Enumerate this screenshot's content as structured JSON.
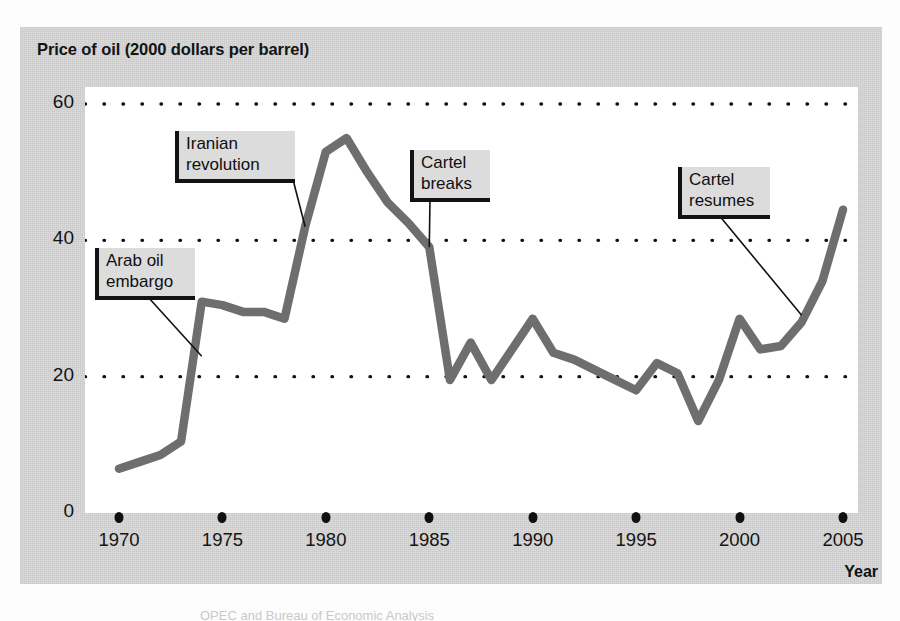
{
  "figure": {
    "title": "Price of oil (2000 dollars per barrel)",
    "x_axis_title": "Year",
    "caption_fragment": "OPEC and Bureau of Economic Analysis"
  },
  "colors": {
    "panel_background": "#d9d9d9",
    "plot_background": "#ffffff",
    "line": "#6e6e6e",
    "gridline": "#111111",
    "text": "#141414",
    "callout_fill": "#dcdcdc",
    "callout_border": "#121212"
  },
  "annotations": [
    {
      "id": "arab-oil-embargo",
      "label": "Arab oil\nembargo",
      "target_year": 1974,
      "target_value": 23
    },
    {
      "id": "iranian-revolution",
      "label": "Iranian\nrevolution",
      "target_year": 1979,
      "target_value": 42
    },
    {
      "id": "cartel-breaks",
      "label": "Cartel\nbreaks",
      "target_year": 1985,
      "target_value": 39
    },
    {
      "id": "cartel-resumes",
      "label": "Cartel\nresumes",
      "target_year": 2003,
      "target_value": 29
    }
  ],
  "chart_data": {
    "type": "line",
    "title": "Price of oil (2000 dollars per barrel)",
    "xlabel": "Year",
    "ylabel": "Price of oil (2000 dollars per barrel)",
    "xlim": [
      1970,
      2005
    ],
    "ylim": [
      0,
      62
    ],
    "yticks": [
      0,
      20,
      40,
      60
    ],
    "ytick_labels": [
      "0",
      "20",
      "40",
      "60"
    ],
    "xticks": [
      1970,
      1975,
      1980,
      1985,
      1990,
      1995,
      2000,
      2005
    ],
    "xtick_labels": [
      "1970",
      "1975",
      "1980",
      "1985",
      "1990",
      "1995",
      "2000",
      "2005"
    ],
    "grid": "horizontal-dotted",
    "legend": "none",
    "series": [
      {
        "name": "Price of oil (2000 dollars per barrel)",
        "x": [
          1970,
          1971,
          1972,
          1973,
          1974,
          1975,
          1976,
          1977,
          1978,
          1979,
          1980,
          1981,
          1982,
          1983,
          1984,
          1985,
          1986,
          1987,
          1988,
          1989,
          1990,
          1991,
          1992,
          1993,
          1994,
          1995,
          1996,
          1997,
          1998,
          1999,
          2000,
          2001,
          2002,
          2003,
          2004,
          2005
        ],
        "values": [
          6.5,
          7.5,
          8.5,
          10.5,
          31,
          30.5,
          29.5,
          29.5,
          28.5,
          42,
          53,
          55,
          50,
          45.5,
          42.5,
          39,
          19.5,
          25,
          19.5,
          24,
          28.5,
          23.5,
          22.5,
          21,
          19.5,
          18,
          22,
          20.5,
          13.5,
          19.5,
          28.5,
          24,
          24.5,
          28,
          34,
          44.5
        ]
      }
    ]
  }
}
